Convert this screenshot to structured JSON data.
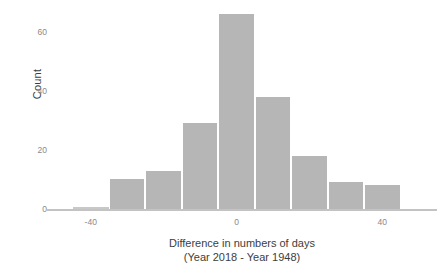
{
  "chart_data": {
    "type": "bar",
    "title": "",
    "subtitle": "",
    "xlabel": "Difference in numbers of days",
    "xlabel_line2": "(Year 2018 - Year 1948)",
    "ylabel": "Count",
    "xlim": [
      -52,
      55
    ],
    "ylim": [
      0,
      68
    ],
    "xticks": [
      -40,
      0,
      40
    ],
    "xticklabels": [
      "-40",
      "0",
      "40"
    ],
    "yticks": [
      0,
      20,
      40,
      60
    ],
    "yticklabels": [
      "0",
      "20",
      "40",
      "60"
    ],
    "grid": false,
    "legend": null,
    "bin_width": 10,
    "bin_edges": [
      -45,
      -35,
      -25,
      -15,
      -5,
      5,
      15,
      25,
      35,
      45
    ],
    "bin_centers": [
      -40,
      -30,
      -20,
      -10,
      0,
      10,
      20,
      30,
      40
    ],
    "categories": [
      "-45 to -35",
      "-35 to -25",
      "-25 to -15",
      "-15 to -5",
      "-5 to 5",
      "5 to 15",
      "15 to 25",
      "25 to 35",
      "35 to 45"
    ],
    "values": [
      0,
      10,
      13,
      29,
      66,
      38,
      18,
      9,
      8
    ],
    "bar_color": "#b6b6b6",
    "axis_color": "#c3c3c3",
    "tick_label_color": "#8a8a8a",
    "axis_title_color": "#3d3d3d",
    "background": "#ffffff"
  },
  "axes": {
    "y_title": "Count",
    "x_title_line1": "Difference in numbers of days",
    "x_title_line2": "(Year 2018 - Year 1948)"
  }
}
